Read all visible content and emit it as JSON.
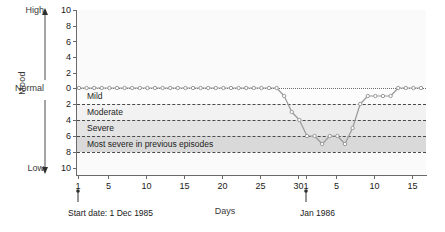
{
  "chart_data": {
    "type": "line",
    "title": "",
    "xlabel": "Days",
    "ylabel": "Mood",
    "grid": true,
    "legend": "none",
    "y_axis": {
      "pole_high": "High",
      "pole_normal": "Normal",
      "pole_low": "Low",
      "ticks_above_normal": [
        10,
        8,
        6,
        4,
        2,
        0
      ],
      "ticks_below_normal": [
        2,
        4,
        6,
        8,
        10
      ],
      "ylim": [
        -10,
        10
      ],
      "direction": "0 at Normal, positive upward (High), magnitude downward (Low)"
    },
    "x_axis": {
      "xlim": [
        1,
        46
      ],
      "tick_values": [
        1,
        5,
        10,
        15,
        20,
        25,
        30,
        31,
        35,
        40,
        45
      ],
      "tick_labels": [
        "1",
        "5",
        "10",
        "15",
        "20",
        "25",
        "30",
        "1",
        "5",
        "10",
        "15"
      ],
      "month_break_at": 31
    },
    "severity_bands": [
      {
        "label": "Mild",
        "from": 0,
        "to": -2,
        "color": "#fcfcfc"
      },
      {
        "label": "Moderate",
        "from": -2,
        "to": -4,
        "color": "#f2f2f2"
      },
      {
        "label": "Severe",
        "from": -4,
        "to": -6,
        "color": "#e4e4e4"
      },
      {
        "label": "Most severe in previous episodes",
        "from": -6,
        "to": -8,
        "color": "#d9d9d9"
      }
    ],
    "series": [
      {
        "name": "Mood",
        "color": "#9a9a9a",
        "marker": "circle",
        "x": [
          1,
          2,
          3,
          4,
          5,
          6,
          7,
          8,
          9,
          10,
          11,
          12,
          13,
          14,
          15,
          16,
          17,
          18,
          19,
          20,
          21,
          22,
          23,
          24,
          25,
          26,
          27,
          28,
          29,
          30,
          31,
          32,
          33,
          34,
          35,
          36,
          37,
          38,
          39,
          40,
          41,
          42,
          43,
          44,
          45,
          46
        ],
        "values": [
          0,
          0,
          0,
          0,
          0,
          0,
          0,
          0,
          0,
          0,
          0,
          0,
          0,
          0,
          0,
          0,
          0,
          0,
          0,
          0,
          0,
          0,
          0,
          0,
          0,
          0,
          0,
          -1,
          -3,
          -4,
          -6,
          -6,
          -7,
          -6,
          -6,
          -7,
          -5,
          -2,
          -1,
          -1,
          -1,
          -1,
          0,
          0,
          0,
          0
        ]
      }
    ],
    "annotations": [
      {
        "name": "start-date",
        "text": "Start date: 1 Dec 1985",
        "at_x": 1
      },
      {
        "name": "month-marker",
        "text": "Jan 1986",
        "at_x": 31
      }
    ]
  },
  "labels": {
    "mood_axis_title": "Mood",
    "days_axis_title": "Days",
    "high": "High",
    "normal": "Normal",
    "low": "Low",
    "band_mild": "Mild",
    "band_moderate": "Moderate",
    "band_severe": "Severe",
    "band_most_severe": "Most severe in previous episodes",
    "start_annotation": "Start date: 1 Dec 1985",
    "month_annotation": "Jan 1986",
    "y": {
      "t10a": "10",
      "t8a": "8",
      "t6a": "6",
      "t4a": "4",
      "t2a": "2",
      "t0": "0",
      "t2b": "2",
      "t4b": "4",
      "t6b": "6",
      "t8b": "8",
      "t10b": "10"
    },
    "x": {
      "d1": "1",
      "d5": "5",
      "d10": "10",
      "d15": "15",
      "d20": "20",
      "d25": "25",
      "d30": "30",
      "j1": "1",
      "j5": "5",
      "j10": "10",
      "j15": "15"
    }
  },
  "colors": {
    "line": "#9a9a9a",
    "axis": "#6a6a6a",
    "grid": "#4a4a4a",
    "text": "#1a1a1a"
  }
}
